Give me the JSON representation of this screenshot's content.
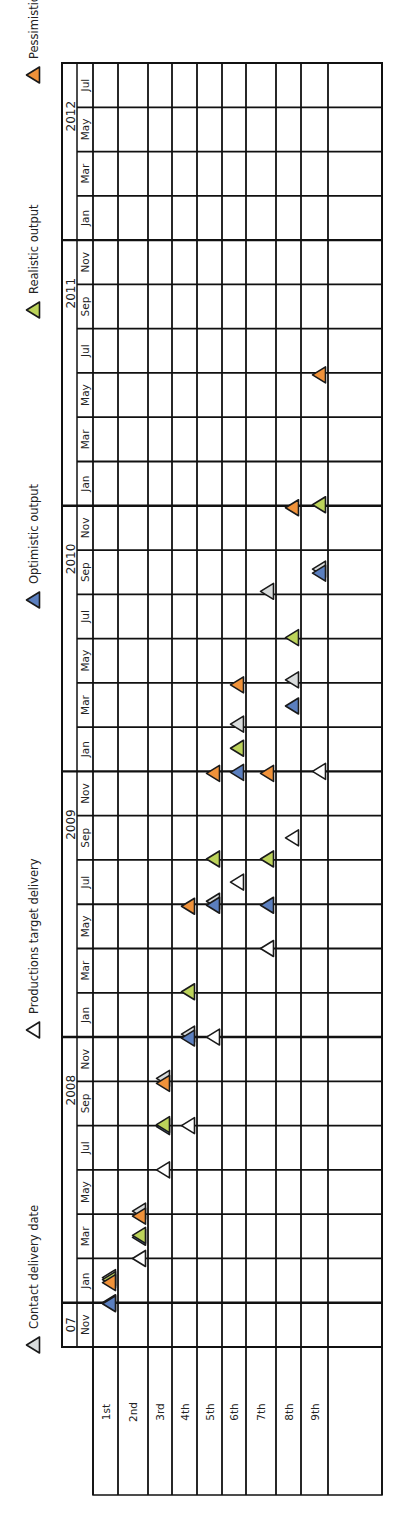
{
  "chart_data": {
    "type": "scatter",
    "orientation": "rotated 90° counter-clockwise (time runs bottom to top, deliveries left to right)",
    "legend": [
      {
        "key": "contract",
        "label": "Contact delivery date",
        "fill": "#d9dcdc"
      },
      {
        "key": "target",
        "label": "Productions target delivery",
        "fill": "#ffffff"
      },
      {
        "key": "optimistic",
        "label": "Optimistic output",
        "fill": "#5b7fbf"
      },
      {
        "key": "realistic",
        "label": "Realistic output",
        "fill": "#bcd35a"
      },
      {
        "key": "pessimistic",
        "label": "Pessimistic output",
        "fill": "#f0923a"
      }
    ],
    "years": [
      {
        "label": "07",
        "from": "Nov 2007",
        "to": "Nov 2007"
      },
      {
        "label": "2008",
        "from": "Jan 2008",
        "to": "Nov 2008"
      },
      {
        "label": "2009",
        "from": "Jan 2009",
        "to": "Nov 2009"
      },
      {
        "label": "2010",
        "from": "Jan 2010",
        "to": "Nov 2010"
      },
      {
        "label": "2011",
        "from": "Jan 2011",
        "to": "Nov 2011"
      },
      {
        "label": "2012",
        "from": "Jan 2012",
        "to": "Jul 2012"
      }
    ],
    "months": [
      "Nov",
      "Jan",
      "Mar",
      "May",
      "Jul",
      "Sep",
      "Nov",
      "Jan",
      "Mar",
      "May",
      "Jul",
      "Sep",
      "Nov",
      "Jan",
      "Mar",
      "May",
      "Jul",
      "Sep",
      "Nov",
      "Jan",
      "Mar",
      "May",
      "Jul",
      "Sep",
      "Nov",
      "Jan",
      "Mar",
      "May",
      "Jul"
    ],
    "deliveries": [
      "1st",
      "2nd",
      "3rd",
      "4th",
      "5th",
      "6th",
      "7th",
      "8th",
      "9th"
    ],
    "series": [
      {
        "name": "Contact delivery date",
        "key": "contract",
        "values": [
          "Feb 2008",
          "May 2008",
          "Nov 2008",
          "Jan 2009",
          "Jul 2009",
          "Mar 2010",
          "Sep 2010",
          "May 2010",
          "Oct 2010"
        ]
      },
      {
        "name": "Productions target delivery",
        "key": "target",
        "values": [
          "Jan 2008",
          "Mar 2008",
          "Jul 2008",
          "Sep 2008",
          "Jan 2009",
          "Aug 2009",
          "May 2009",
          "Oct 2009",
          "Jan 2010"
        ]
      },
      {
        "name": "Optimistic output",
        "key": "optimistic",
        "values": [
          "Jan 2008",
          "Apr 2008",
          "Sep 2008",
          "Jan 2009",
          "Jul 2009",
          "Jan 2010",
          "Jul 2009",
          "Apr 2010",
          "Oct 2010"
        ]
      },
      {
        "name": "Realistic output",
        "key": "realistic",
        "values": [
          "Feb 2008",
          "Apr 2008",
          "Sep 2008",
          "Mar 2009",
          "Sep 2009",
          "Feb 2010",
          "Sep 2009",
          "Jul 2010",
          "Jan 2011"
        ]
      },
      {
        "name": "Pessimistic output",
        "key": "pessimistic",
        "values": [
          "Feb 2008",
          "May 2008",
          "Nov 2008",
          "Jul 2009",
          "Jan 2010",
          "May 2010",
          "Jan 2010",
          "Jan 2011",
          "Jul 2011"
        ]
      }
    ],
    "xlabel": "Delivery",
    "ylabel": "Date (bimonthly)",
    "grid": true
  },
  "labels": {
    "legend": [
      "Contact delivery date",
      "Productions target delivery",
      "Optimistic output",
      "Realistic output",
      "Pessimistic output"
    ],
    "years": [
      "07",
      "2008",
      "2009",
      "2010",
      "2011",
      "2012"
    ],
    "deliveries": [
      "1st",
      "2nd",
      "3rd",
      "4th",
      "5th",
      "6th",
      "7th",
      "8th",
      "9th"
    ]
  }
}
